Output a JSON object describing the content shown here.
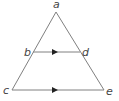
{
  "diagram": {
    "colors": {
      "line": "#808080",
      "arrow": "#222222",
      "label": "#444444",
      "background": "#ffffff"
    },
    "points": {
      "a": {
        "label": "a",
        "x": 56,
        "y": 12
      },
      "b": {
        "label": "b",
        "x": 33,
        "y": 52
      },
      "c": {
        "label": "c",
        "x": 12,
        "y": 90
      },
      "d": {
        "label": "d",
        "x": 80,
        "y": 52
      },
      "e": {
        "label": "e",
        "x": 104,
        "y": 90
      }
    },
    "segments": [
      {
        "from": "a",
        "to": "c"
      },
      {
        "from": "a",
        "to": "e"
      },
      {
        "from": "b",
        "to": "d",
        "parallel_marker": "arrow-right"
      },
      {
        "from": "c",
        "to": "e",
        "parallel_marker": "arrow-right"
      }
    ],
    "parallel_statement": "bd ∥ ce"
  }
}
